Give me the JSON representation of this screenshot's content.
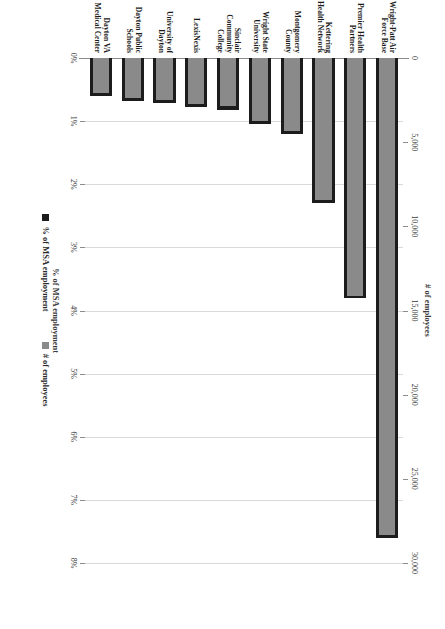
{
  "chart_data": {
    "type": "bar",
    "orientation": "horizontal-rotated",
    "title": "",
    "categories": [
      "Wright-Patt Air Force Base",
      "Premier Health Partners",
      "Kettering Health Network",
      "Montgomery County",
      "Wright State University",
      "Sinclair Community College",
      "LexisNexis",
      "University of Dayton",
      "Dayton Public Schools",
      "Dayton VA Medical Center"
    ],
    "series": [
      {
        "name": "% of MSA employment",
        "axis": "primary",
        "values": [
          7.6,
          3.8,
          2.3,
          1.2,
          1.05,
          0.82,
          0.78,
          0.72,
          0.68,
          0.6
        ]
      },
      {
        "name": "# of employees",
        "axis": "secondary",
        "values": [
          28500,
          14300,
          8600,
          4500,
          3950,
          3050,
          2900,
          2700,
          2550,
          2250
        ]
      }
    ],
    "primary_axis": {
      "label": "% of MSA employment",
      "ticks": [
        "0%",
        "1%",
        "2%",
        "3%",
        "4%",
        "5%",
        "6%",
        "7%",
        "8%"
      ],
      "tick_values": [
        0,
        1,
        2,
        3,
        4,
        5,
        6,
        7,
        8
      ],
      "min": 0,
      "max": 8
    },
    "secondary_axis": {
      "label": "# of employees",
      "ticks": [
        "0",
        "5,000",
        "10,000",
        "15,000",
        "20,000",
        "25,000",
        "30,000"
      ],
      "tick_values": [
        0,
        5000,
        10000,
        15000,
        20000,
        25000,
        30000
      ],
      "min": 0,
      "max": 30000
    },
    "legend": {
      "position": "bottom",
      "entries": [
        {
          "label": "% of MSA employment",
          "color": "#1c1c1c"
        },
        {
          "label": "# of employees",
          "color": "#8a8a8a"
        }
      ]
    },
    "grid": true,
    "colors": {
      "series_percent": "#1c1c1c",
      "series_count": "#8a8a8a",
      "gridline": "#d9d9d9",
      "axis": "#8c8c8c",
      "background": "#ffffff"
    }
  }
}
